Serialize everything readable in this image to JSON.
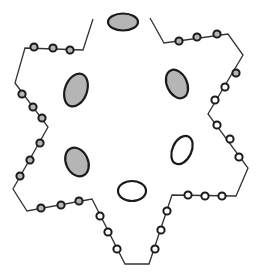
{
  "diagram": {
    "title": "",
    "colors": {
      "background": "#ffffff",
      "stroke": "#1a1a1a",
      "line": "#333333",
      "gray_fill": "#b5b5b5",
      "white_fill": "#ffffff"
    },
    "outline_points": [
      [
        93,
        19
      ],
      [
        83,
        50
      ],
      [
        25,
        48
      ],
      [
        15,
        83
      ],
      [
        48,
        127
      ],
      [
        13,
        189
      ],
      [
        27,
        211
      ],
      [
        92,
        199
      ],
      [
        125,
        264
      ],
      [
        149,
        264
      ],
      [
        172,
        195
      ],
      [
        236,
        196
      ],
      [
        248,
        168
      ],
      [
        208,
        114
      ],
      [
        243,
        55
      ],
      [
        228,
        34
      ],
      [
        164,
        43
      ],
      [
        150,
        18
      ]
    ],
    "beads": [
      {
        "x": 34,
        "y": 47,
        "fill": "gray"
      },
      {
        "x": 53,
        "y": 48,
        "fill": "gray"
      },
      {
        "x": 70,
        "y": 50,
        "fill": "gray"
      },
      {
        "x": 22,
        "y": 94,
        "fill": "gray"
      },
      {
        "x": 33,
        "y": 107,
        "fill": "gray"
      },
      {
        "x": 42,
        "y": 118,
        "fill": "gray"
      },
      {
        "x": 40,
        "y": 143,
        "fill": "gray"
      },
      {
        "x": 30,
        "y": 160,
        "fill": "gray"
      },
      {
        "x": 20,
        "y": 176,
        "fill": "gray"
      },
      {
        "x": 41,
        "y": 208,
        "fill": "gray"
      },
      {
        "x": 61,
        "y": 205,
        "fill": "gray"
      },
      {
        "x": 79,
        "y": 201,
        "fill": "gray"
      },
      {
        "x": 100,
        "y": 216,
        "fill": "white"
      },
      {
        "x": 108,
        "y": 232,
        "fill": "white"
      },
      {
        "x": 117,
        "y": 249,
        "fill": "white"
      },
      {
        "x": 155,
        "y": 249,
        "fill": "white"
      },
      {
        "x": 161,
        "y": 230,
        "fill": "white"
      },
      {
        "x": 167,
        "y": 211,
        "fill": "white"
      },
      {
        "x": 188,
        "y": 195,
        "fill": "white"
      },
      {
        "x": 205,
        "y": 196,
        "fill": "white"
      },
      {
        "x": 222,
        "y": 196,
        "fill": "white"
      },
      {
        "x": 239,
        "y": 157,
        "fill": "white"
      },
      {
        "x": 230,
        "y": 139,
        "fill": "white"
      },
      {
        "x": 217,
        "y": 125,
        "fill": "white"
      },
      {
        "x": 215,
        "y": 100,
        "fill": "white"
      },
      {
        "x": 225,
        "y": 87,
        "fill": "white"
      },
      {
        "x": 236,
        "y": 73,
        "fill": "gray"
      },
      {
        "x": 217,
        "y": 34,
        "fill": "gray"
      },
      {
        "x": 197,
        "y": 37,
        "fill": "gray"
      },
      {
        "x": 179,
        "y": 41,
        "fill": "gray"
      }
    ],
    "ovals": [
      {
        "name": "top",
        "cx": 123,
        "cy": 22,
        "rx": 15,
        "ry": 8.5,
        "rotate": 0,
        "fill": "gray"
      },
      {
        "name": "upper-left",
        "cx": 76,
        "cy": 90,
        "rx": 11,
        "ry": 17,
        "rotate": 20,
        "fill": "gray"
      },
      {
        "name": "upper-right",
        "cx": 177,
        "cy": 84,
        "rx": 10,
        "ry": 15,
        "rotate": -25,
        "fill": "gray"
      },
      {
        "name": "lower-left",
        "cx": 77,
        "cy": 162,
        "rx": 11,
        "ry": 15,
        "rotate": -25,
        "fill": "gray"
      },
      {
        "name": "lower-right",
        "cx": 182,
        "cy": 150,
        "rx": 9.5,
        "ry": 15,
        "rotate": 25,
        "fill": "white"
      },
      {
        "name": "bottom",
        "cx": 132,
        "cy": 191,
        "rx": 14,
        "ry": 10,
        "rotate": 0,
        "fill": "white"
      }
    ]
  }
}
